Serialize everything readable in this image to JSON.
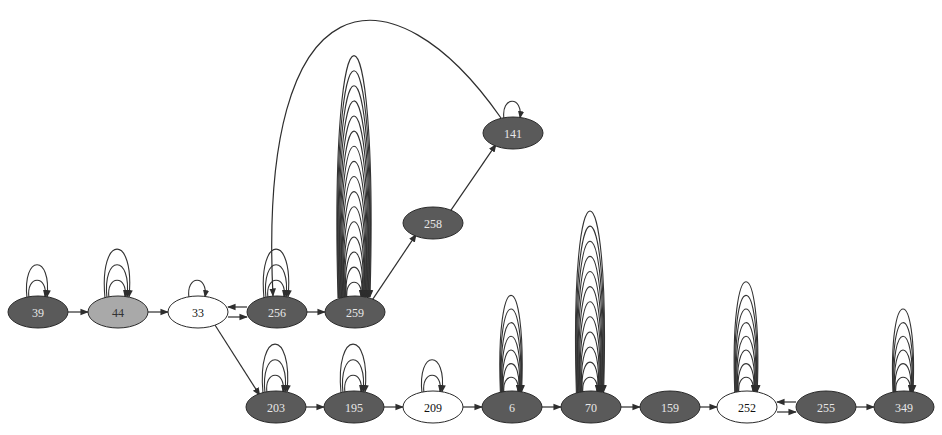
{
  "diagram": {
    "title": "",
    "colors": {
      "dark_node": "#5a5a5a",
      "light_gray_node": "#a9a9a9",
      "white_node": "#ffffff",
      "edge": "#2e2e2e",
      "dark_label": "#e8e8e8",
      "light_label": "#111111"
    },
    "nodes": [
      {
        "id": "39",
        "label": "39",
        "x": 38,
        "y": 312,
        "style": "dark",
        "self_loops": 2
      },
      {
        "id": "44",
        "label": "44",
        "x": 118,
        "y": 312,
        "style": "gray",
        "self_loops": 3
      },
      {
        "id": "33",
        "label": "33",
        "x": 198,
        "y": 312,
        "style": "white",
        "self_loops": 1
      },
      {
        "id": "256",
        "label": "256",
        "x": 277,
        "y": 312,
        "style": "dark",
        "self_loops": 3
      },
      {
        "id": "259",
        "label": "259",
        "x": 355,
        "y": 312,
        "style": "dark",
        "self_loops": 16
      },
      {
        "id": "258",
        "label": "258",
        "x": 433,
        "y": 223,
        "style": "dark",
        "self_loops": 0
      },
      {
        "id": "141",
        "label": "141",
        "x": 513,
        "y": 133,
        "style": "dark",
        "self_loops": 1
      },
      {
        "id": "203",
        "label": "203",
        "x": 276,
        "y": 407,
        "style": "dark",
        "self_loops": 3
      },
      {
        "id": "195",
        "label": "195",
        "x": 354,
        "y": 407,
        "style": "dark",
        "self_loops": 3
      },
      {
        "id": "209",
        "label": "209",
        "x": 433,
        "y": 407,
        "style": "white",
        "self_loops": 2
      },
      {
        "id": "6",
        "label": "6",
        "x": 512,
        "y": 407,
        "style": "dark",
        "self_loops": 7
      },
      {
        "id": "70",
        "label": "70",
        "x": 591,
        "y": 407,
        "style": "dark",
        "self_loops": 12
      },
      {
        "id": "159",
        "label": "159",
        "x": 670,
        "y": 407,
        "style": "dark",
        "self_loops": 0
      },
      {
        "id": "252",
        "label": "252",
        "x": 747,
        "y": 407,
        "style": "white",
        "self_loops": 8
      },
      {
        "id": "255",
        "label": "255",
        "x": 826,
        "y": 407,
        "style": "dark",
        "self_loops": 0
      },
      {
        "id": "349",
        "label": "349",
        "x": 904,
        "y": 407,
        "style": "dark",
        "self_loops": 6
      }
    ],
    "edges": [
      {
        "from": "39",
        "to": "44"
      },
      {
        "from": "44",
        "to": "33"
      },
      {
        "from": "33",
        "to": "256"
      },
      {
        "from": "256",
        "to": "33"
      },
      {
        "from": "256",
        "to": "259"
      },
      {
        "from": "259",
        "to": "258"
      },
      {
        "from": "258",
        "to": "141"
      },
      {
        "from": "141",
        "to": "256"
      },
      {
        "from": "33",
        "to": "203"
      },
      {
        "from": "203",
        "to": "195"
      },
      {
        "from": "195",
        "to": "209"
      },
      {
        "from": "209",
        "to": "6"
      },
      {
        "from": "6",
        "to": "70"
      },
      {
        "from": "70",
        "to": "159"
      },
      {
        "from": "159",
        "to": "252"
      },
      {
        "from": "252",
        "to": "255"
      },
      {
        "from": "255",
        "to": "252"
      },
      {
        "from": "255",
        "to": "349"
      }
    ]
  }
}
